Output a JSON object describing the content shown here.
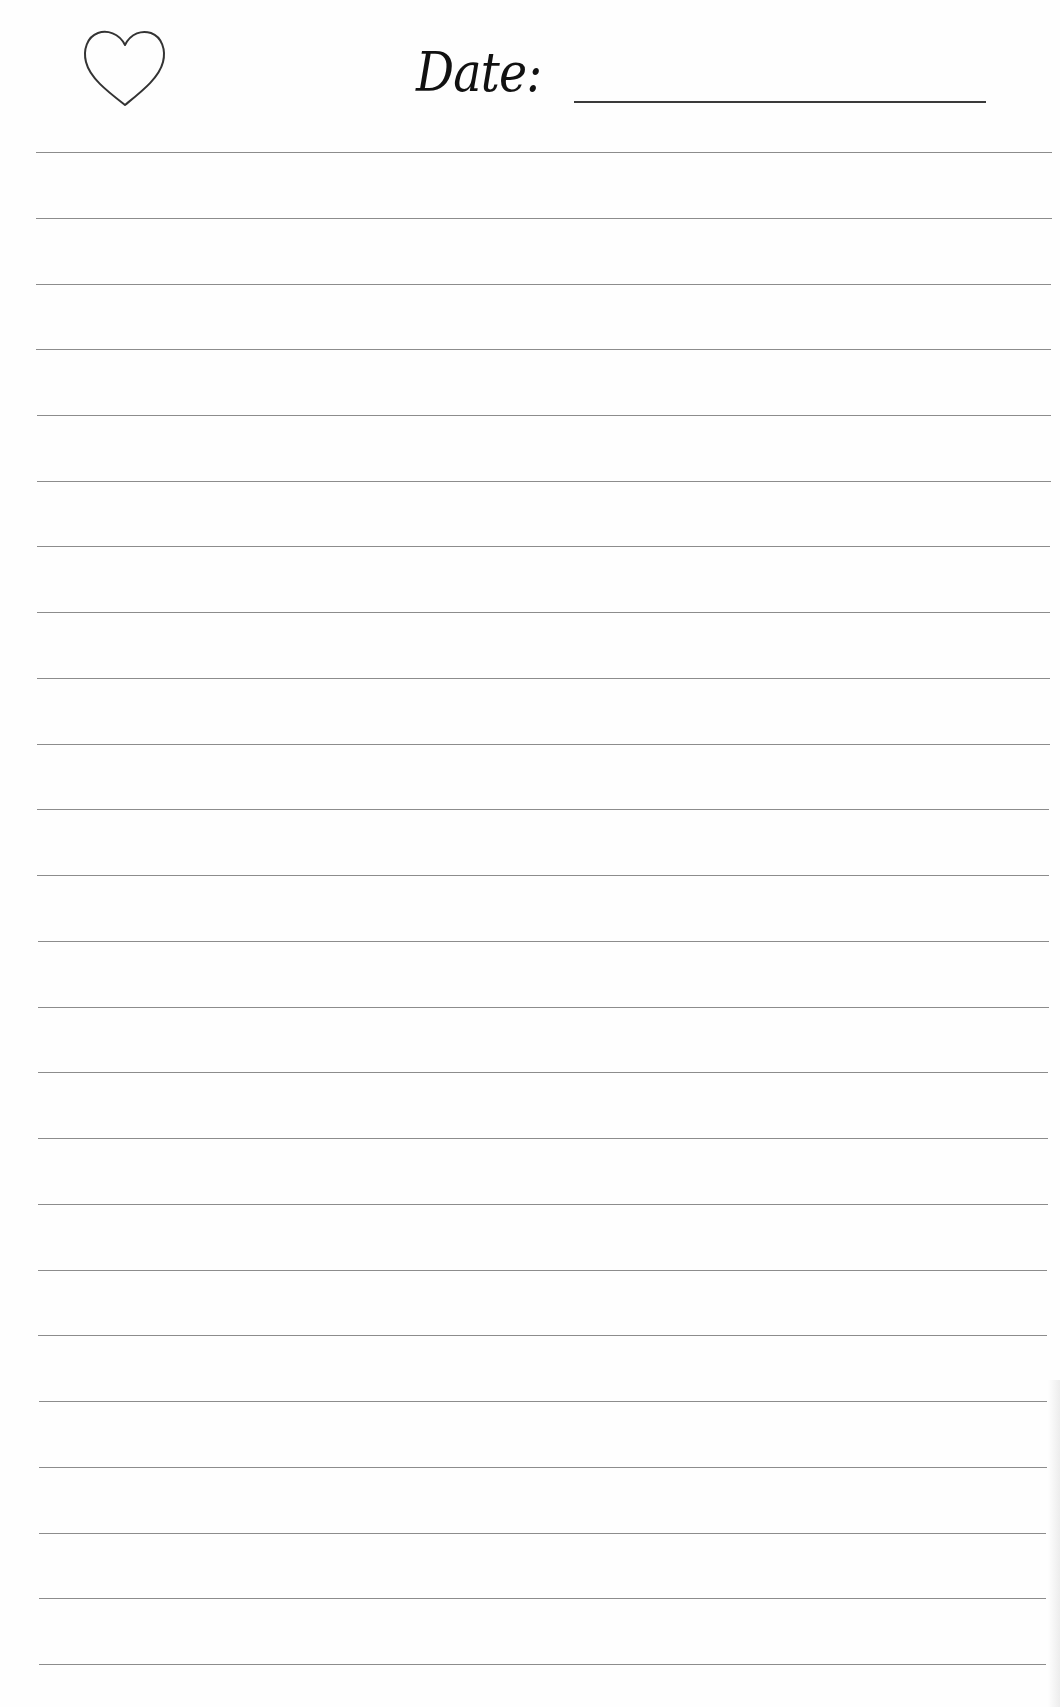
{
  "header": {
    "icon": "heart-outline-icon",
    "date_label": "Date:",
    "date_value": ""
  },
  "ruled_area": {
    "line_count": 24,
    "first_line_y": 152,
    "line_spacing": 65.74,
    "left_x_top": 36,
    "right_x_top": 1052,
    "left_x_bottom": 39,
    "right_x_bottom": 1046
  },
  "colors": {
    "paper": "#fefefe",
    "rule_line": "#8c8c8c",
    "ink": "#111111",
    "date_underline": "#3a3a3a"
  }
}
